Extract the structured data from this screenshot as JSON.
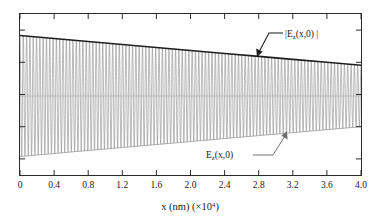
{
  "figure": {
    "background_color": "#ffffff",
    "frame_color": "#2b2b2b"
  },
  "axes": {
    "x": {
      "title_main": "x (nm) (",
      "title_mult": "×10",
      "title_exp": "4",
      "title_close": ")",
      "title_full": "x (nm) (×10⁴)",
      "ticks": [
        "0",
        "0.4",
        "0.8",
        "1.2",
        "1.6",
        "2.0",
        "2.4",
        "2.8",
        "3.2",
        "3.6",
        "4.0"
      ],
      "range": [
        0,
        4.0
      ],
      "units": "nm ×10^4"
    },
    "y": {
      "title": "",
      "ticks": [
        "",
        "",
        "",
        "",
        ""
      ],
      "tick_count": 5,
      "labels_visible": false
    }
  },
  "annotations": [
    {
      "name": "envelope-label",
      "text_prefix": "|E",
      "text_sub": "z",
      "text_suffix": "(x,0) |",
      "text_full": "|E_z(x,0)|",
      "color": "#1d1d1d",
      "points_to": "upper envelope curve"
    },
    {
      "name": "field-label",
      "text_prefix": "E",
      "text_sub": "z",
      "text_suffix": "(x,0)",
      "text_full": "E_z(x,0)",
      "color": "#3a3a3a",
      "points_to": "oscillating field trace"
    }
  ],
  "chart_data": {
    "type": "line",
    "title": "",
    "xlabel": "x (nm) (×10⁴)",
    "ylabel": "",
    "xlim": [
      0,
      4.0
    ],
    "ylim": [
      -1.0,
      1.0
    ],
    "grid": false,
    "legend": "none (inline annotations)",
    "oscillation_cycles": 103,
    "series": [
      {
        "name": "|E_z(x,0)|",
        "role": "envelope",
        "color": "#1d1d1d",
        "description": "Magnitude envelope of the field, decaying approximately linearly with x",
        "x": [
          0.0,
          0.4,
          0.8,
          1.2,
          1.6,
          2.0,
          2.4,
          2.8,
          3.2,
          3.6,
          4.0
        ],
        "values": [
          0.865,
          0.822,
          0.778,
          0.736,
          0.693,
          0.651,
          0.608,
          0.566,
          0.523,
          0.481,
          0.438
        ]
      },
      {
        "name": "-|E_z(x,0)|",
        "role": "envelope-mirror",
        "color": "#9a9a9a",
        "description": "Negative mirror of the magnitude envelope",
        "x": [
          0.0,
          0.4,
          0.8,
          1.2,
          1.6,
          2.0,
          2.4,
          2.8,
          3.2,
          3.6,
          4.0
        ],
        "values": [
          -0.865,
          -0.822,
          -0.778,
          -0.736,
          -0.693,
          -0.651,
          -0.608,
          -0.566,
          -0.523,
          -0.481,
          -0.438
        ]
      },
      {
        "name": "E_z(x,0)",
        "role": "oscillating-field",
        "color": "#8d8d8d",
        "description": "Rapidly oscillating standing-wave field bounded by the decaying envelope; about 103 full cycles across the plotted range",
        "x_start": 0.0,
        "x_end": 4.0,
        "amplitude_start": 0.865,
        "amplitude_end": 0.438
      }
    ]
  }
}
